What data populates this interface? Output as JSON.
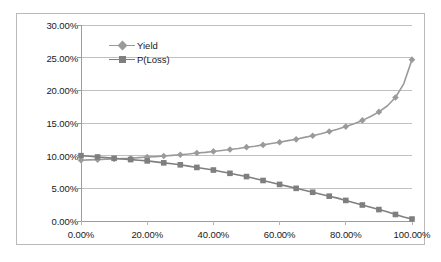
{
  "chart_data": {
    "type": "line",
    "title": "",
    "xlabel": "",
    "ylabel": "",
    "xlim": [
      0,
      100
    ],
    "ylim": [
      0,
      30
    ],
    "grid": true,
    "grid_axis": "y",
    "legend_position": "top-center-left",
    "x_tick_labels": [
      "0.00%",
      "20.00%",
      "40.00%",
      "60.00%",
      "80.00%",
      "100.00%"
    ],
    "x_ticks": [
      0,
      20,
      40,
      60,
      80,
      100
    ],
    "y_tick_labels": [
      "0.00%",
      "5.00%",
      "10.00%",
      "15.00%",
      "20.00%",
      "25.00%",
      "30.00%"
    ],
    "y_ticks": [
      0,
      5,
      10,
      15,
      20,
      25,
      30
    ],
    "x": [
      0,
      2.5,
      5,
      7.5,
      10,
      12.5,
      15,
      17.5,
      20,
      22.5,
      25,
      27.5,
      30,
      32.5,
      35,
      37.5,
      40,
      42.5,
      45,
      47.5,
      50,
      52.5,
      55,
      57.5,
      60,
      62.5,
      65,
      67.5,
      70,
      72.5,
      75,
      77.5,
      80,
      82.5,
      85,
      87.5,
      90,
      92.5,
      95,
      97.5,
      100
    ],
    "series": [
      {
        "name": "Yield",
        "color": "#9a9a9a",
        "marker": "diamond",
        "values": [
          9.3,
          9.35,
          9.4,
          9.45,
          9.5,
          9.55,
          9.6,
          9.7,
          9.8,
          9.85,
          9.95,
          10.05,
          10.15,
          10.25,
          10.4,
          10.5,
          10.65,
          10.8,
          10.95,
          11.1,
          11.3,
          11.45,
          11.65,
          11.85,
          12.05,
          12.3,
          12.5,
          12.8,
          13.05,
          13.35,
          13.7,
          14.05,
          14.45,
          14.9,
          15.4,
          16.0,
          16.7,
          17.6,
          18.9,
          21.0,
          24.7
        ]
      },
      {
        "name": "P(Loss)",
        "color": "#7f7f7f",
        "marker": "square",
        "values": [
          10.0,
          9.9,
          9.8,
          9.7,
          9.6,
          9.5,
          9.4,
          9.3,
          9.2,
          9.05,
          8.9,
          8.75,
          8.6,
          8.4,
          8.2,
          8.0,
          7.8,
          7.55,
          7.3,
          7.05,
          6.8,
          6.5,
          6.2,
          5.9,
          5.6,
          5.3,
          5.0,
          4.7,
          4.4,
          4.1,
          3.8,
          3.5,
          3.15,
          2.8,
          2.45,
          2.1,
          1.75,
          1.4,
          1.0,
          0.6,
          0.3
        ]
      }
    ]
  },
  "legend": {
    "entries": [
      {
        "label": "Yield"
      },
      {
        "label": "P(Loss)"
      }
    ]
  }
}
